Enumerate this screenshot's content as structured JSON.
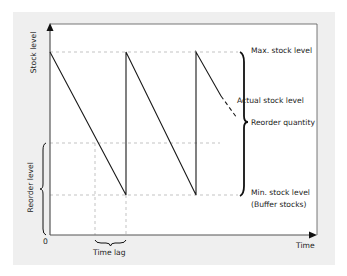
{
  "diagram": {
    "y_axis_label": "Stock level",
    "x_axis_label": "Time",
    "origin_label": "0",
    "labels": {
      "max_stock": "Max. stock level",
      "actual_stock": "Actual stock level",
      "reorder_quantity": "Reorder quantity",
      "min_stock_line1": "Min. stock level",
      "min_stock_line2": "(Buffer stocks)",
      "reorder_level": "Reorder level",
      "time_lag": "Time lag"
    },
    "colors": {
      "frame_background": "#efefef",
      "plot_background": "#ffffff",
      "line": "#1a1a1a",
      "guide_dash": "#aaaaaa"
    }
  }
}
